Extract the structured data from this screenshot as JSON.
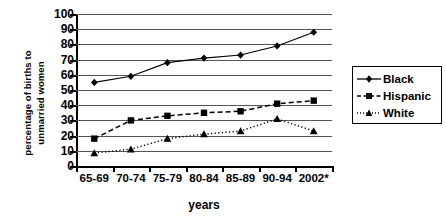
{
  "chart_data": {
    "type": "line",
    "title": "",
    "xlabel": "years",
    "ylabel_line1": "percentage of births to",
    "ylabel_line2": "unmarried women",
    "categories": [
      "65-69",
      "70-74",
      "75-79",
      "80-84",
      "85-89",
      "90-94",
      "2002*"
    ],
    "ylim": [
      0,
      100
    ],
    "yticks": [
      0,
      10,
      20,
      30,
      40,
      50,
      60,
      70,
      80,
      90,
      100
    ],
    "grid": true,
    "legend_position": "right",
    "series": [
      {
        "name": "Black",
        "marker": "diamond",
        "line": "solid",
        "values": [
          55,
          59,
          68,
          71,
          73,
          79,
          88
        ]
      },
      {
        "name": "Hispanic",
        "marker": "square",
        "line": "dashed",
        "values": [
          18,
          30,
          33,
          35,
          36,
          41,
          43
        ]
      },
      {
        "name": "White",
        "marker": "triangle",
        "line": "dotted",
        "values": [
          8.5,
          11,
          18,
          21,
          23,
          31,
          23
        ]
      }
    ]
  },
  "legend": {
    "items": [
      {
        "label": "Black"
      },
      {
        "label": "Hispanic"
      },
      {
        "label": "White"
      }
    ]
  }
}
